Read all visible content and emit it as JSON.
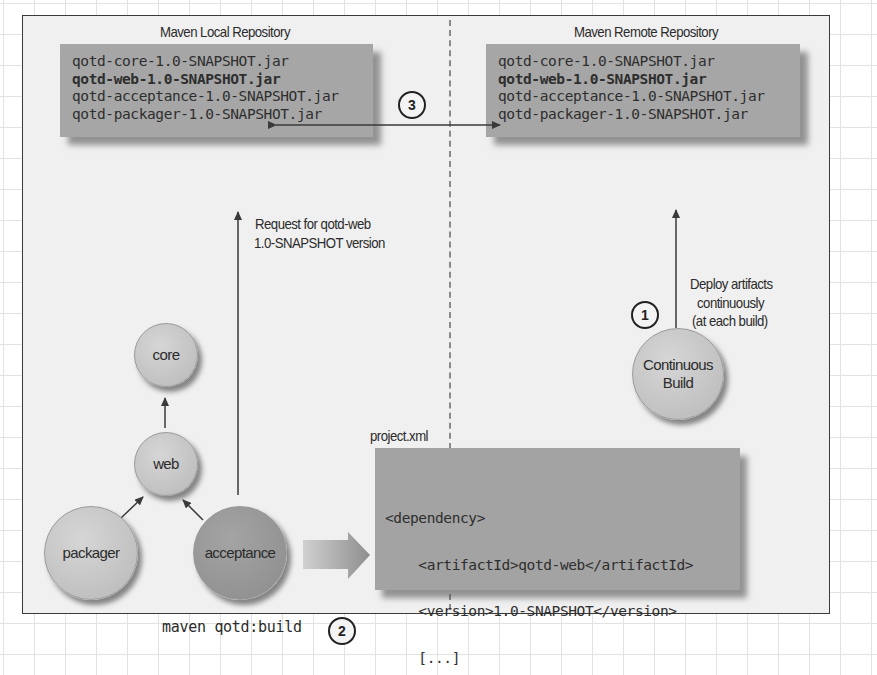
{
  "local_repository": {
    "title": "Maven Local Repository",
    "artifacts": [
      "qotd-core-1.0-SNAPSHOT.jar",
      "qotd-web-1.0-SNAPSHOT.jar",
      "qotd-acceptance-1.0-SNAPSHOT.jar",
      "qotd-packager-1.0-SNAPSHOT.jar"
    ]
  },
  "remote_repository": {
    "title": "Maven Remote Repository",
    "artifacts": [
      "qotd-core-1.0-SNAPSHOT.jar",
      "qotd-web-1.0-SNAPSHOT.jar",
      "qotd-acceptance-1.0-SNAPSHOT.jar",
      "qotd-packager-1.0-SNAPSHOT.jar"
    ],
    "highlighted_artifact": "qotd-web-1.0-SNAPSHOT.jar"
  },
  "steps": {
    "deploy": "1",
    "build": "2",
    "fetch": "3"
  },
  "annotations": {
    "request_line1": "Request for qotd-web",
    "request_line2": "1.0-SNAPSHOT version",
    "deploy_line1": "Deploy artifacts",
    "deploy_line2": "continuously",
    "deploy_line3": "(at each build)"
  },
  "nodes": {
    "core": "core",
    "web": "web",
    "packager": "packager",
    "acceptance": "acceptance",
    "continuous_build_line1": "Continuous",
    "continuous_build_line2": "Build"
  },
  "project_file": {
    "filename": "project.xml",
    "lines": [
      "<dependency>",
      "    <artifactId>qotd-web</artifactId>",
      "    <version>1.0-SNAPSHOT</version>",
      "    [...]",
      "</dependency>"
    ]
  },
  "command": "maven qotd:build",
  "colors": {
    "frame_border": "#3a3a3a",
    "panel_bg": "#f0f0f0",
    "box_fill": "#a6a6a6",
    "light_node": "#c8c8c8",
    "dark_node": "#979797",
    "text": "#2b2b2b"
  }
}
